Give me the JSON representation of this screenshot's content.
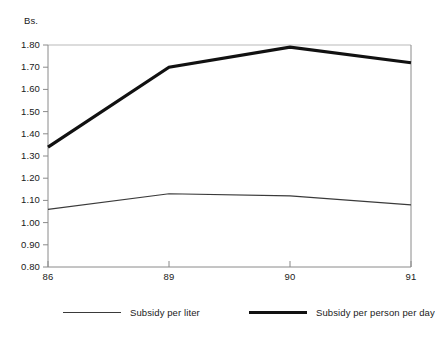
{
  "top_caption": {
    "text": "•                    •",
    "note": "faint cropped strip at very top of image"
  },
  "chart_data": {
    "type": "line",
    "title": "",
    "subtitle": "",
    "xlabel": "",
    "ylabel": "Bs.",
    "unit_label": "Bs.",
    "categories": [
      "86",
      "89",
      "90",
      "91"
    ],
    "x_tick_labels": [
      "86",
      "89",
      "90",
      "91"
    ],
    "y_tick_labels": [
      "1.80",
      "1.70",
      "1.60",
      "1.50",
      "1.40",
      "1.30",
      "1.20",
      "1.10",
      "1.00",
      "0.90",
      "0.80"
    ],
    "ylim": [
      0.8,
      1.8
    ],
    "ytick_step": 0.1,
    "grid": false,
    "top_rule": true,
    "legend_position": "bottom",
    "series": [
      {
        "name": "Subsidy per liter",
        "values": [
          1.06,
          1.13,
          1.12,
          1.08
        ],
        "style": "thin",
        "color": "#3a3a3a",
        "width": 1.2
      },
      {
        "name": "Subsidy per person per day",
        "values": [
          1.34,
          1.7,
          1.79,
          1.72
        ],
        "style": "thick",
        "color": "#111111",
        "width": 3.2
      }
    ]
  },
  "legend": {
    "entries": [
      {
        "label": "Subsidy per liter",
        "style": "thin"
      },
      {
        "label": "Subsidy per person per day",
        "style": "thick"
      }
    ]
  },
  "colors": {
    "axis": "#8a8a8a",
    "top_rule": "#b9b9b9",
    "thin_series": "#3a3a3a",
    "thick_series": "#111111",
    "text": "#1a1a1a",
    "background": "#ffffff"
  }
}
